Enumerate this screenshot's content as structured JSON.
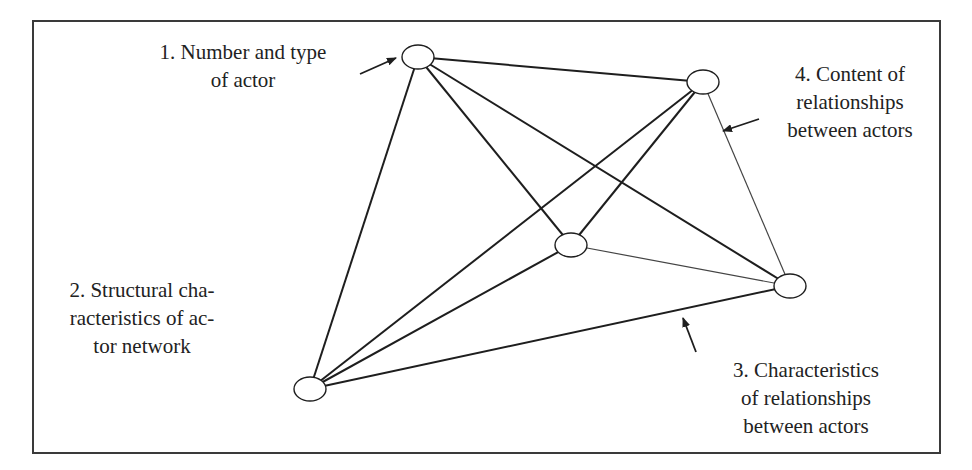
{
  "diagram": {
    "type": "actor-network",
    "colors": {
      "line": "#1e1e1e",
      "thin_line": "#444444",
      "frame": "#3a3a3a",
      "text": "#222222",
      "background": "#ffffff"
    },
    "nodes": [
      {
        "id": "n1",
        "cx": 418,
        "cy": 57,
        "rx": 16,
        "ry": 12
      },
      {
        "id": "n4",
        "cx": 703,
        "cy": 82,
        "rx": 16,
        "ry": 12
      },
      {
        "id": "nc",
        "cx": 571,
        "cy": 245,
        "rx": 16,
        "ry": 12
      },
      {
        "id": "n5",
        "cx": 790,
        "cy": 286,
        "rx": 16,
        "ry": 12
      },
      {
        "id": "n2",
        "cx": 310,
        "cy": 389,
        "rx": 16,
        "ry": 12
      }
    ],
    "edges": [
      {
        "from": "n1",
        "to": "n4",
        "weight": 2
      },
      {
        "from": "n1",
        "to": "nc",
        "weight": 2
      },
      {
        "from": "n1",
        "to": "n5",
        "weight": 2
      },
      {
        "from": "n1",
        "to": "n2",
        "weight": 2
      },
      {
        "from": "n4",
        "to": "nc",
        "weight": 2
      },
      {
        "from": "n4",
        "to": "n2",
        "weight": 2
      },
      {
        "from": "n4",
        "to": "n5",
        "weight": 1.2
      },
      {
        "from": "nc",
        "to": "n2",
        "weight": 2
      },
      {
        "from": "nc",
        "to": "n5",
        "weight": 1.2
      },
      {
        "from": "n5",
        "to": "n2",
        "weight": 2
      }
    ],
    "arrows": [
      {
        "id": "arrow-1",
        "x1": 360,
        "y1": 74,
        "x2": 396,
        "y2": 58
      },
      {
        "id": "arrow-4",
        "x1": 759,
        "y1": 119,
        "x2": 723,
        "y2": 131
      },
      {
        "id": "arrow-3",
        "x1": 696,
        "y1": 352,
        "x2": 683,
        "y2": 318
      }
    ],
    "labels": {
      "label1": {
        "lines": [
          "1. Number and type",
          "of actor"
        ]
      },
      "label2": {
        "lines": [
          "2. Structural cha-",
          "racteristics of ac-",
          "tor network"
        ]
      },
      "label3": {
        "lines": [
          "3. Characteristics",
          "of relationships",
          "between actors"
        ]
      },
      "label4": {
        "lines": [
          "4. Content of",
          "relationships",
          "between actors"
        ]
      }
    }
  }
}
